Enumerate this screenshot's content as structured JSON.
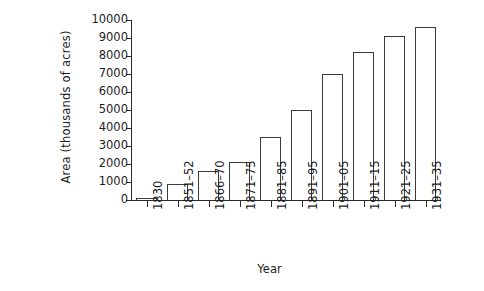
{
  "chart_data": {
    "type": "bar",
    "title": "",
    "xlabel": "Year",
    "ylabel": "Area (thousands of acres)",
    "categories": [
      "1830",
      "1851–52",
      "1866–70",
      "1871–75",
      "1881–85",
      "1891–95",
      "1901–05",
      "1911–15",
      "1921–25",
      "1931–35"
    ],
    "values": [
      100,
      900,
      1600,
      2100,
      3500,
      5000,
      7000,
      8200,
      9100,
      9600
    ],
    "ylim": [
      0,
      10000
    ],
    "yticks": [
      0,
      1000,
      2000,
      3000,
      4000,
      5000,
      6000,
      7000,
      8000,
      9000,
      10000
    ],
    "ytick_labels": [
      "0",
      "1000",
      "2000",
      "3000",
      "4000",
      "5000",
      "6000",
      "7000",
      "8000",
      "9000",
      "10000"
    ],
    "grid": false,
    "legend": null,
    "bar_fill": "#ffffff",
    "bar_edge": "#3a3a3a",
    "axis_color": "#2a2a2a",
    "background": "#ffffff"
  }
}
